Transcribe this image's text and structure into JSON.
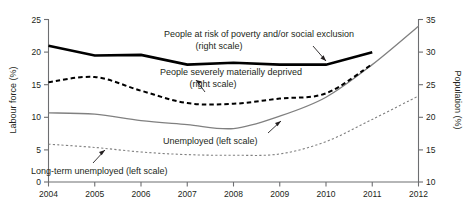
{
  "chart_data": {
    "type": "line",
    "title": "",
    "xlabel": "",
    "ylabel": "Labour force (%)",
    "y2label": "Population (%)",
    "x": [
      2004,
      2005,
      2006,
      2007,
      2008,
      2009,
      2010,
      2011,
      2012
    ],
    "xticklabels": [
      "2004",
      "2005",
      "2006",
      "2007",
      "2008",
      "2009",
      "2010",
      "2011",
      "2012"
    ],
    "xlim": [
      2004,
      2012
    ],
    "ylim": [
      0,
      25
    ],
    "yticklabels": [
      "0",
      "5",
      "10",
      "15",
      "20",
      "25"
    ],
    "yticks": [
      0,
      5,
      10,
      15,
      20,
      25
    ],
    "y2lim": [
      10,
      35
    ],
    "y2ticklabels": [
      "10",
      "15",
      "20",
      "25",
      "30",
      "35"
    ],
    "y2ticks": [
      10,
      15,
      20,
      25,
      30,
      35
    ],
    "grid": false,
    "legend": "inline-annotations",
    "series": [
      {
        "name": "People at risk of poverty and/or social exclusion",
        "scale": "right",
        "axis": "y2",
        "style": "solid-thick",
        "color": "#000000",
        "x": [
          2004,
          2005,
          2006,
          2007,
          2008,
          2009,
          2010,
          2011
        ],
        "values": [
          30.9,
          29.4,
          29.5,
          28.0,
          28.3,
          28.0,
          28.0,
          29.9
        ]
      },
      {
        "name": "People severely materially deprived",
        "scale": "right",
        "axis": "y2",
        "style": "dashed",
        "color": "#000000",
        "x": [
          2004,
          2005,
          2006,
          2007,
          2008,
          2009,
          2010,
          2011
        ],
        "values": [
          25.3,
          26.1,
          24.0,
          22.1,
          22.0,
          22.8,
          23.6,
          28.1
        ]
      },
      {
        "name": "Unemployed",
        "scale": "left",
        "axis": "y",
        "style": "solid-thin",
        "color": "#808080",
        "x": [
          2004,
          2005,
          2006,
          2007,
          2008,
          2009,
          2010,
          2011,
          2012
        ],
        "values": [
          10.6,
          10.4,
          9.4,
          8.8,
          8.2,
          10.1,
          13.0,
          18.0,
          23.9
        ]
      },
      {
        "name": "Long-term unemployed",
        "scale": "left",
        "axis": "y",
        "style": "dotted",
        "color": "#808080",
        "x": [
          2004,
          2005,
          2006,
          2007,
          2008,
          2009,
          2010,
          2011,
          2012
        ],
        "values": [
          5.8,
          5.3,
          4.6,
          4.2,
          4.1,
          4.3,
          6.2,
          9.6,
          13.2
        ]
      }
    ],
    "annotations": [
      {
        "name": "annotation-poverty",
        "line1": "People at risk of poverty and/or social exclusion",
        "line2": "(right scale)"
      },
      {
        "name": "annotation-deprived",
        "line1": "People severely materially deprived",
        "line2": "(right scale)"
      },
      {
        "name": "annotation-unemployed",
        "line1": "Unemployed (left scale)",
        "line2": ""
      },
      {
        "name": "annotation-longterm",
        "line1": "Long-term unemployed (left scale)",
        "line2": ""
      }
    ]
  },
  "axes": {
    "left_title": "Labour force (%)",
    "right_title": "Population (%)"
  },
  "colors": {
    "axis": "#6d6e71",
    "ink": "#231f20",
    "grey_series": "#808080",
    "black_series": "#000000"
  }
}
